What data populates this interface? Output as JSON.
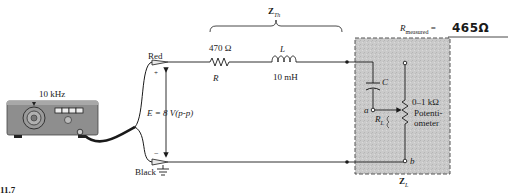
{
  "figure": {
    "caption_fragment": "11.7"
  },
  "generator": {
    "frequency_label": "10 kHz"
  },
  "leads": {
    "red_label": "Red",
    "black_label": "Black",
    "plus": "+",
    "minus": "−"
  },
  "source": {
    "label": "E = 8 V(p-p)"
  },
  "thevenin": {
    "label": "Z",
    "subscript": "Th",
    "resistor": {
      "value": "470 Ω",
      "symbol": "R"
    },
    "inductor": {
      "symbol": "L",
      "value": "10 mH"
    }
  },
  "load": {
    "label": "Z",
    "subscript": "L",
    "capacitor_symbol": "C",
    "node_a": "a",
    "node_b": "b",
    "rl_symbol": "R",
    "rl_subscript": "L",
    "pot_range": "0–1 kΩ",
    "pot_name_line1": "Potenti-",
    "pot_name_line2": "ometer"
  },
  "measurement": {
    "label": "R",
    "subscript": "measured",
    "equals": "=",
    "handwritten_value": "465Ω"
  },
  "colors": {
    "wire": "#1a1a1a",
    "load_box_fill": "#c9c9c9",
    "load_box_border": "#555555",
    "generator_body": "#8a8a8a"
  }
}
